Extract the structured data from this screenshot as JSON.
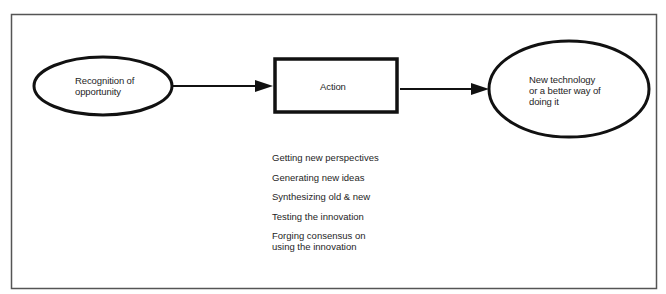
{
  "diagram": {
    "type": "flow",
    "nodes": {
      "start": {
        "shape": "ellipse",
        "label_lines": [
          "Recognition of",
          "opportunity"
        ]
      },
      "action": {
        "shape": "rectangle",
        "label": "Action"
      },
      "end": {
        "shape": "ellipse",
        "label_lines": [
          "New technology",
          "or a better way of",
          "doing it"
        ]
      }
    },
    "edges": [
      {
        "from": "start",
        "to": "action"
      },
      {
        "from": "action",
        "to": "end"
      }
    ],
    "action_steps": [
      {
        "lines": [
          "Getting new perspectives"
        ]
      },
      {
        "lines": [
          "Generating new ideas"
        ]
      },
      {
        "lines": [
          "Synthesizing old & new"
        ]
      },
      {
        "lines": [
          "Testing the innovation"
        ]
      },
      {
        "lines": [
          "Forging consensus on",
          "using the innovation"
        ]
      }
    ],
    "colors": {
      "stroke": "#111111",
      "frame": "#555555",
      "background": "#ffffff",
      "text": "#1e1e1e"
    }
  }
}
